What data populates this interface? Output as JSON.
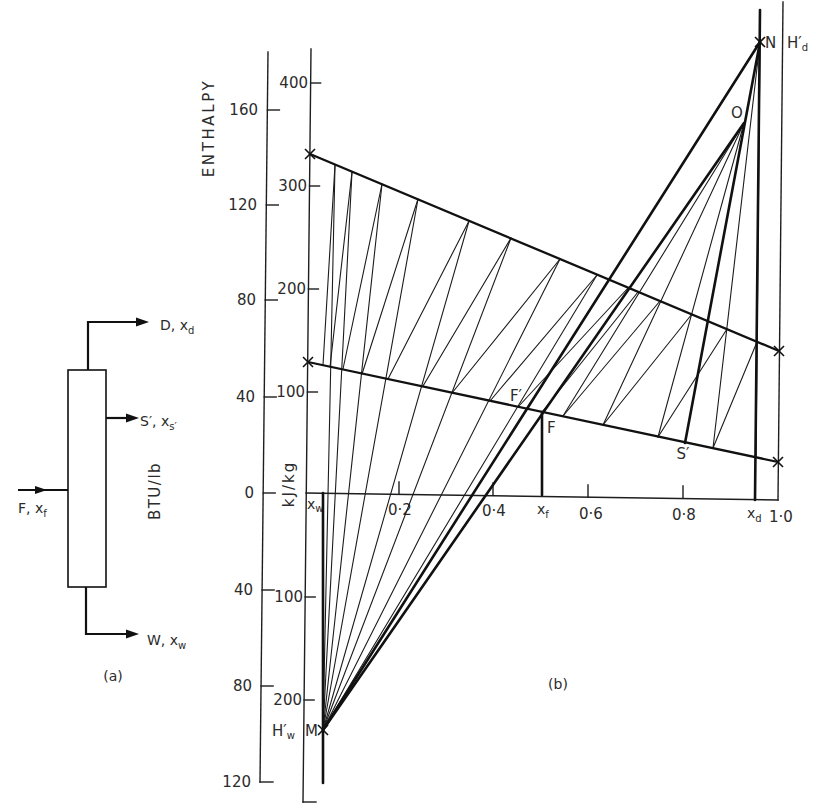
{
  "panel_a": {
    "caption": "(a)",
    "streams": {
      "distillate": {
        "main": "D, x",
        "sub": "d"
      },
      "side_stream": {
        "main": "S′, x",
        "sub": "s′"
      },
      "feed": {
        "main": "F, x",
        "sub": "f"
      },
      "bottoms": {
        "main": "W, x",
        "sub": "w"
      }
    },
    "unit_label": "BTU/lb"
  },
  "panel_b": {
    "caption": "(b)",
    "y_axis_title": "ENTHALPY",
    "btu_axis": {
      "unit": "BTU/lb",
      "ticks": [
        "160",
        "120",
        "80",
        "40",
        "0",
        "40",
        "80",
        "120"
      ]
    },
    "kj_axis": {
      "unit": "kJ/kg",
      "ticks_above": [
        "400",
        "300",
        "200",
        "100"
      ],
      "ticks_below": [
        "100",
        "200"
      ]
    },
    "x_axis": {
      "ticks": [
        "0·2",
        "0·4",
        "0·6",
        "0·8",
        "1·0"
      ],
      "x_w": {
        "main": "x",
        "sub": "w"
      },
      "x_f": {
        "main": "x",
        "sub": "f"
      },
      "x_d": {
        "main": "x",
        "sub": "d"
      }
    },
    "points": {
      "N": "N",
      "H_d": {
        "main": "H′",
        "sub": "d"
      },
      "O": "O",
      "F_prime": "F′",
      "F": "F",
      "S_prime": "S′",
      "M": "M",
      "H_w": {
        "main": "H′",
        "sub": "w"
      }
    }
  },
  "diagram_geometry": {
    "thick_lines": [
      {
        "name": "saturated-vapour-line",
        "cls": "sat",
        "pts": [
          310,
          154,
          779,
          351
        ]
      },
      {
        "name": "saturated-liquid-line",
        "cls": "sat",
        "pts": [
          308,
          362,
          778,
          462
        ]
      },
      {
        "name": "line-N-M",
        "cls": "thick",
        "pts": [
          760,
          42,
          323,
          730
        ]
      },
      {
        "name": "line-O-M",
        "cls": "thick",
        "pts": [
          744,
          123,
          323,
          730
        ]
      },
      {
        "name": "line-N-O-S-prime",
        "cls": "thick",
        "pts": [
          760,
          42,
          685,
          443
        ]
      },
      {
        "name": "x-w-vertical",
        "cls": "thick",
        "pts": [
          323,
          493,
          323,
          783
        ]
      },
      {
        "name": "x-f-vertical",
        "cls": "thick",
        "pts": [
          542,
          412,
          542,
          495
        ]
      },
      {
        "name": "x-d-vertical",
        "cls": "thick",
        "pts": [
          760,
          10,
          755,
          500
        ]
      }
    ],
    "thin_lines": [
      [
        323,
        730,
        335,
        165
      ],
      [
        323,
        730,
        352,
        172
      ],
      [
        323,
        730,
        382,
        184
      ],
      [
        323,
        730,
        418,
        199
      ],
      [
        323,
        730,
        469,
        221
      ],
      [
        323,
        730,
        511,
        238
      ],
      [
        323,
        730,
        560,
        259
      ],
      [
        323,
        730,
        597,
        275
      ],
      [
        323,
        365,
        335,
        165
      ],
      [
        330,
        367,
        352,
        172
      ],
      [
        343,
        369,
        382,
        184
      ],
      [
        362,
        374,
        418,
        199
      ],
      [
        388,
        379,
        469,
        221
      ],
      [
        423,
        386,
        511,
        238
      ],
      [
        452,
        393,
        560,
        259
      ],
      [
        490,
        401,
        597,
        275
      ],
      [
        518,
        407,
        628,
        288
      ],
      [
        542,
        412,
        638,
        292
      ],
      [
        563,
        416,
        660,
        301
      ],
      [
        603,
        425,
        692,
        314
      ],
      [
        658,
        437,
        727,
        329
      ],
      [
        713,
        448,
        757,
        342
      ],
      [
        744,
        123,
        563,
        416
      ],
      [
        744,
        123,
        603,
        425
      ],
      [
        744,
        123,
        658,
        437
      ],
      [
        760,
        42,
        713,
        448
      ],
      [
        760,
        42,
        756,
        457
      ]
    ],
    "markers": [
      [
        310,
        154
      ],
      [
        308,
        362
      ],
      [
        779,
        351
      ],
      [
        778,
        462
      ],
      [
        760,
        42
      ],
      [
        323,
        730
      ]
    ]
  },
  "chart_data": {
    "type": "line",
    "title": "",
    "xlabel": "",
    "ylabel": "ENTHALPY",
    "xlim": [
      0,
      1
    ],
    "x_ticks": [
      "0·2",
      "0·4",
      "0·6",
      "0·8",
      "1·0"
    ],
    "y_left": {
      "unit": "BTU/lb",
      "range": [
        -120,
        160
      ]
    },
    "y_right": {
      "unit": "kJ/kg",
      "range": [
        -230,
        450
      ]
    },
    "grid": false,
    "series": [
      {
        "name": "saturated vapour enthalpy",
        "x": [
          0,
          1
        ],
        "y_kJ_per_kg": [
          330,
          145
        ]
      },
      {
        "name": "saturated liquid enthalpy",
        "x": [
          0,
          1
        ],
        "y_kJ_per_kg": [
          127,
          37
        ]
      }
    ],
    "points": [
      {
        "label": "N (H′d)",
        "x": 0.96,
        "y_kJ_per_kg": 445
      },
      {
        "label": "O",
        "x": 0.93,
        "y_kJ_per_kg": 365
      },
      {
        "label": "F′",
        "x": 0.47,
        "y_kJ_per_kg": 86
      },
      {
        "label": "F",
        "x": 0.5,
        "y_kJ_per_kg": 81
      },
      {
        "label": "S′",
        "x": 0.8,
        "y_kJ_per_kg": 54
      },
      {
        "label": "M (H′w)",
        "x": 0.03,
        "y_kJ_per_kg": -230
      }
    ],
    "compositions": {
      "x_w": 0.03,
      "x_f": 0.5,
      "x_d": 0.96
    }
  }
}
